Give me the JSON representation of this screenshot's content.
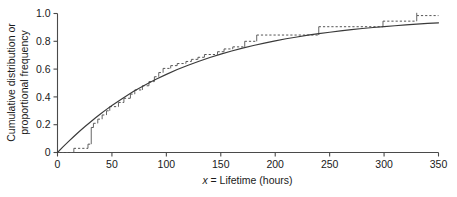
{
  "chart_data": {
    "type": "line",
    "title": "",
    "xlabel": "x = Lifetime (hours)",
    "xlabel_italic_part": "x",
    "xlabel_rest": " = Lifetime (hours)",
    "ylabel_line1": "Cumulative distribution or",
    "ylabel_line2": "proportional frequency",
    "xlim": [
      0,
      350
    ],
    "ylim": [
      0,
      1.0
    ],
    "grid": false,
    "legend": "none",
    "xticks": [
      0,
      50,
      100,
      150,
      200,
      250,
      300,
      350
    ],
    "xticklabels": [
      "0",
      "50",
      "100",
      "150",
      "200",
      "250",
      "300",
      "350"
    ],
    "yticks": [
      0,
      0.2,
      0.4,
      0.6,
      0.8,
      1.0
    ],
    "yticklabels": [
      "0",
      "0.2",
      "0.4",
      "0.6",
      "0.8",
      "1.0"
    ],
    "series": [
      {
        "name": "Theoretical cumulative distribution (exponential)",
        "style": "solid",
        "color": "#3a3a3a",
        "type": "curve",
        "formula_mean_hours": 122,
        "x": [
          0,
          5,
          10,
          15,
          20,
          25,
          30,
          35,
          40,
          45,
          50,
          60,
          70,
          80,
          90,
          100,
          110,
          120,
          130,
          140,
          150,
          160,
          170,
          180,
          190,
          200,
          210,
          220,
          230,
          240,
          250,
          260,
          270,
          280,
          290,
          300,
          310,
          320,
          330,
          340,
          350
        ],
        "y": [
          0.0,
          0.04,
          0.078,
          0.115,
          0.151,
          0.185,
          0.218,
          0.25,
          0.281,
          0.31,
          0.338,
          0.391,
          0.44,
          0.484,
          0.525,
          0.562,
          0.597,
          0.628,
          0.657,
          0.683,
          0.708,
          0.73,
          0.751,
          0.77,
          0.787,
          0.803,
          0.818,
          0.831,
          0.844,
          0.855,
          0.865,
          0.875,
          0.884,
          0.892,
          0.899,
          0.906,
          0.912,
          0.918,
          0.924,
          0.929,
          0.933
        ]
      },
      {
        "name": "Empirical cumulative proportional frequency (step)",
        "style": "dashed",
        "color": "#555555",
        "type": "step",
        "step_x": [
          0,
          15,
          28,
          31,
          33,
          37,
          41,
          45,
          48,
          56,
          61,
          67,
          71,
          78,
          84,
          89,
          93,
          97,
          104,
          110,
          118,
          123,
          129,
          135,
          147,
          153,
          161,
          172,
          183,
          240,
          299,
          330,
          350
        ],
        "step_y": [
          0.0,
          0.03,
          0.06,
          0.18,
          0.21,
          0.24,
          0.27,
          0.3,
          0.33,
          0.36,
          0.39,
          0.42,
          0.45,
          0.48,
          0.51,
          0.545,
          0.575,
          0.605,
          0.625,
          0.64,
          0.655,
          0.67,
          0.685,
          0.705,
          0.725,
          0.745,
          0.76,
          0.8,
          0.845,
          0.905,
          0.945,
          0.985,
          0.985
        ]
      }
    ]
  }
}
